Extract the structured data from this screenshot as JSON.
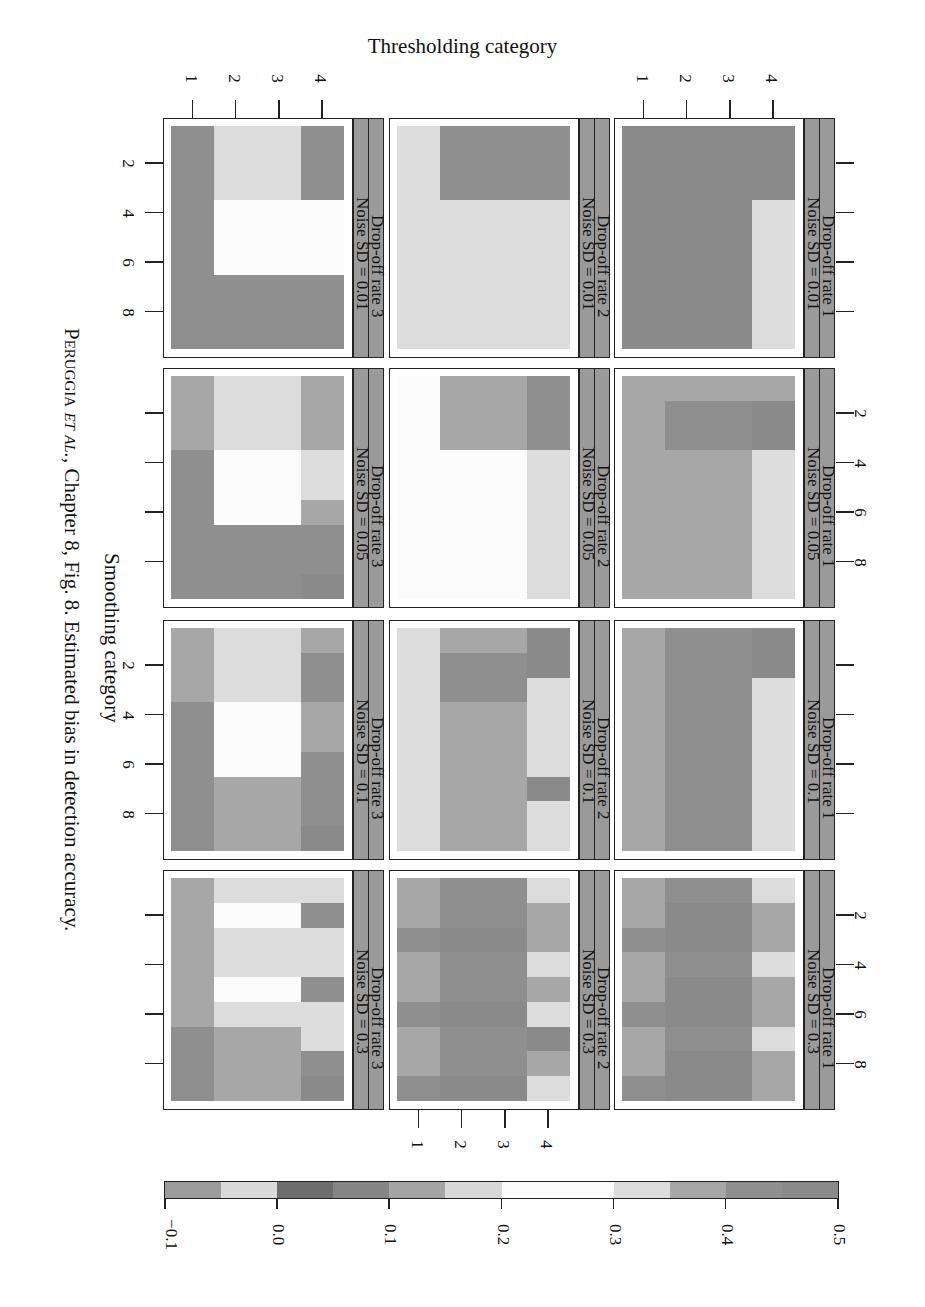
{
  "title": "Thresholding category",
  "xaxis_label": "Smoothing category",
  "caption": {
    "author": "Peruggia",
    "etal": "et al.",
    "rest": ", Chapter 8, Fig. 8. Estimated bias in detection accuracy."
  },
  "legend": {
    "breaks": [
      -0.1,
      -0.05,
      0.0,
      0.05,
      0.1,
      0.15,
      0.2,
      0.25,
      0.3,
      0.35,
      0.4,
      0.45,
      0.5
    ],
    "tick_labels": [
      "−0.1",
      "0.0",
      "0.1",
      "0.2",
      "0.3",
      "0.4",
      "0.5"
    ],
    "colors": [
      "#9b9b9b",
      "#dadada",
      "#6d6d6d",
      "#858585",
      "#a4a4a4",
      "#d8d8d8",
      "#fbfbfb",
      "#fbfbfb",
      "#dcdcdc",
      "#a7a7a7",
      "#8f8f8f",
      "#8a8a8a"
    ]
  },
  "chart_data": {
    "type": "heatmap",
    "title": "Estimated bias in detection accuracy",
    "xlabel": "Smoothing category",
    "ylabel": "Thresholding category",
    "x": [
      1,
      2,
      3,
      4,
      5,
      6,
      7,
      8,
      9
    ],
    "y": [
      1,
      2,
      3,
      4
    ],
    "x_tick_labels": [
      "2",
      "4",
      "6",
      "8"
    ],
    "y_tick_labels": [
      "1",
      "2",
      "3",
      "4"
    ],
    "zlim": [
      -0.1,
      0.5
    ],
    "rows_facet": "Drop-off rate",
    "cols_facet": "Noise SD",
    "panels": [
      {
        "dropoff": "Drop-off rate 1",
        "noise": "Noise SD = 0.01",
        "values": [
          [
            0.47,
            0.47,
            0.47,
            0.47,
            0.47,
            0.47,
            0.47,
            0.47,
            0.47
          ],
          [
            0.47,
            0.47,
            0.47,
            0.47,
            0.47,
            0.47,
            0.47,
            0.47,
            0.47
          ],
          [
            0.47,
            0.47,
            0.47,
            0.47,
            0.47,
            0.47,
            0.47,
            0.47,
            0.47
          ],
          [
            0.47,
            0.47,
            0.47,
            0.32,
            0.32,
            0.32,
            0.32,
            0.32,
            0.32
          ]
        ]
      },
      {
        "dropoff": "Drop-off rate 1",
        "noise": "Noise SD = 0.05",
        "values": [
          [
            0.37,
            0.37,
            0.37,
            0.37,
            0.37,
            0.37,
            0.37,
            0.37,
            0.37
          ],
          [
            0.37,
            0.43,
            0.43,
            0.37,
            0.37,
            0.37,
            0.37,
            0.37,
            0.37
          ],
          [
            0.37,
            0.43,
            0.43,
            0.37,
            0.37,
            0.37,
            0.37,
            0.37,
            0.37
          ],
          [
            0.37,
            0.49,
            0.49,
            0.32,
            0.32,
            0.32,
            0.32,
            0.32,
            0.32
          ]
        ]
      },
      {
        "dropoff": "Drop-off rate 1",
        "noise": "Noise SD = 0.1",
        "values": [
          [
            0.37,
            0.37,
            0.37,
            0.37,
            0.37,
            0.37,
            0.37,
            0.37,
            0.37
          ],
          [
            0.43,
            0.43,
            0.43,
            0.43,
            0.43,
            0.43,
            0.43,
            0.43,
            0.43
          ],
          [
            0.43,
            0.43,
            0.43,
            0.43,
            0.43,
            0.43,
            0.43,
            0.43,
            0.43
          ],
          [
            0.49,
            0.49,
            0.32,
            0.32,
            0.32,
            0.32,
            0.32,
            0.32,
            0.32
          ]
        ]
      },
      {
        "dropoff": "Drop-off rate 1",
        "noise": "Noise SD = 0.3",
        "values": [
          [
            0.37,
            0.37,
            0.43,
            0.37,
            0.37,
            0.43,
            0.37,
            0.37,
            0.43
          ],
          [
            0.43,
            0.49,
            0.49,
            0.43,
            0.49,
            0.49,
            0.43,
            0.49,
            0.49
          ],
          [
            0.43,
            0.49,
            0.49,
            0.43,
            0.49,
            0.49,
            0.43,
            0.49,
            0.49
          ],
          [
            0.32,
            0.37,
            0.37,
            0.32,
            0.37,
            0.37,
            0.32,
            0.37,
            0.37
          ]
        ]
      },
      {
        "dropoff": "Drop-off rate 2",
        "noise": "Noise SD = 0.01",
        "values": [
          [
            0.32,
            0.32,
            0.32,
            0.32,
            0.32,
            0.32,
            0.32,
            0.32,
            0.32
          ],
          [
            0.43,
            0.43,
            0.43,
            0.32,
            0.32,
            0.32,
            0.32,
            0.32,
            0.32
          ],
          [
            0.43,
            0.43,
            0.43,
            0.32,
            0.32,
            0.32,
            0.32,
            0.32,
            0.32
          ],
          [
            0.43,
            0.43,
            0.43,
            0.32,
            0.32,
            0.32,
            0.32,
            0.32,
            0.32
          ]
        ]
      },
      {
        "dropoff": "Drop-off rate 2",
        "noise": "Noise SD = 0.05",
        "values": [
          [
            0.25,
            0.25,
            0.25,
            0.25,
            0.25,
            0.25,
            0.25,
            0.25,
            0.25
          ],
          [
            0.37,
            0.37,
            0.37,
            0.25,
            0.25,
            0.25,
            0.25,
            0.25,
            0.25
          ],
          [
            0.37,
            0.37,
            0.37,
            0.25,
            0.25,
            0.25,
            0.25,
            0.25,
            0.25
          ],
          [
            0.43,
            0.43,
            0.43,
            0.32,
            0.32,
            0.32,
            0.32,
            0.32,
            0.32
          ]
        ]
      },
      {
        "dropoff": "Drop-off rate 2",
        "noise": "Noise SD = 0.1",
        "values": [
          [
            0.32,
            0.32,
            0.32,
            0.32,
            0.32,
            0.32,
            0.32,
            0.32,
            0.32
          ],
          [
            0.37,
            0.43,
            0.43,
            0.37,
            0.37,
            0.37,
            0.37,
            0.37,
            0.37
          ],
          [
            0.37,
            0.43,
            0.43,
            0.37,
            0.37,
            0.37,
            0.37,
            0.37,
            0.37
          ],
          [
            0.49,
            0.49,
            0.32,
            0.32,
            0.32,
            0.32,
            0.49,
            0.32,
            0.32
          ]
        ]
      },
      {
        "dropoff": "Drop-off rate 2",
        "noise": "Noise SD = 0.3",
        "values": [
          [
            0.37,
            0.37,
            0.43,
            0.37,
            0.37,
            0.43,
            0.37,
            0.37,
            0.43
          ],
          [
            0.43,
            0.43,
            0.49,
            0.43,
            0.43,
            0.49,
            0.43,
            0.43,
            0.49
          ],
          [
            0.43,
            0.43,
            0.49,
            0.43,
            0.43,
            0.49,
            0.43,
            0.43,
            0.49
          ],
          [
            0.32,
            0.37,
            0.37,
            0.32,
            0.37,
            0.32,
            0.49,
            0.37,
            0.32
          ]
        ]
      },
      {
        "dropoff": "Drop-off rate 3",
        "noise": "Noise SD = 0.01",
        "values": [
          [
            0.43,
            0.43,
            0.43,
            0.43,
            0.43,
            0.43,
            0.43,
            0.43,
            0.43
          ],
          [
            0.32,
            0.32,
            0.32,
            0.25,
            0.25,
            0.25,
            0.43,
            0.43,
            0.43
          ],
          [
            0.32,
            0.32,
            0.32,
            0.25,
            0.25,
            0.25,
            0.43,
            0.43,
            0.43
          ],
          [
            0.43,
            0.43,
            0.43,
            0.25,
            0.25,
            0.25,
            0.43,
            0.43,
            0.43
          ]
        ]
      },
      {
        "dropoff": "Drop-off rate 3",
        "noise": "Noise SD = 0.05",
        "values": [
          [
            0.37,
            0.37,
            0.37,
            0.43,
            0.43,
            0.43,
            0.43,
            0.43,
            0.43
          ],
          [
            0.32,
            0.32,
            0.32,
            0.25,
            0.25,
            0.25,
            0.43,
            0.43,
            0.43
          ],
          [
            0.32,
            0.32,
            0.32,
            0.25,
            0.25,
            0.25,
            0.43,
            0.43,
            0.43
          ],
          [
            0.37,
            0.37,
            0.37,
            0.32,
            0.32,
            0.37,
            0.43,
            0.43,
            0.49
          ]
        ]
      },
      {
        "dropoff": "Drop-off rate 3",
        "noise": "Noise SD = 0.1",
        "values": [
          [
            0.37,
            0.37,
            0.37,
            0.43,
            0.43,
            0.43,
            0.43,
            0.43,
            0.43
          ],
          [
            0.32,
            0.32,
            0.32,
            0.25,
            0.25,
            0.25,
            0.37,
            0.37,
            0.37
          ],
          [
            0.32,
            0.32,
            0.32,
            0.25,
            0.25,
            0.25,
            0.37,
            0.37,
            0.37
          ],
          [
            0.37,
            0.43,
            0.43,
            0.37,
            0.37,
            0.43,
            0.43,
            0.43,
            0.49
          ]
        ]
      },
      {
        "dropoff": "Drop-off rate 3",
        "noise": "Noise SD = 0.3",
        "values": [
          [
            0.37,
            0.37,
            0.37,
            0.37,
            0.37,
            0.37,
            0.43,
            0.43,
            0.43
          ],
          [
            0.32,
            0.25,
            0.32,
            0.32,
            0.25,
            0.32,
            0.37,
            0.37,
            0.37
          ],
          [
            0.32,
            0.25,
            0.32,
            0.32,
            0.25,
            0.32,
            0.37,
            0.37,
            0.37
          ],
          [
            0.32,
            0.43,
            0.32,
            0.32,
            0.43,
            0.32,
            0.32,
            0.43,
            0.49
          ]
        ]
      }
    ]
  }
}
